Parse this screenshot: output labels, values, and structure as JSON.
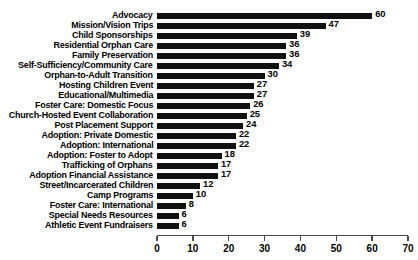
{
  "chart_data": {
    "type": "bar",
    "orientation": "horizontal",
    "title": "",
    "subtitle": "",
    "xlabel": "",
    "ylabel": "",
    "xlim": [
      0,
      70
    ],
    "xticks": [
      0,
      10,
      20,
      30,
      40,
      50,
      60,
      70
    ],
    "grid": false,
    "legend": false,
    "bar_color": "#111111",
    "axis_color": "#4a4a4a",
    "background_color": "#ffffff",
    "show_value_labels": true,
    "categories": [
      "Advocacy",
      "Mission/Vision Trips",
      "Child Sponsorships",
      "Residential Orphan Care",
      "Family Preservation",
      "Self-Sufficiency/Community Care",
      "Orphan-to-Adult Transition",
      "Hosting Children Event",
      "Educational/Multimedia",
      "Foster Care: Domestic Focus",
      "Church-Hosted Event Collaboration",
      "Post Placement Support",
      "Adoption: Private Domestic",
      "Adoption: International",
      "Adoption: Foster to Adopt",
      "Trafficking of Orphans",
      "Adoption Financial Assistance",
      "Street/Incarcerated Children",
      "Camp Programs",
      "Foster Care: International",
      "Special Needs Resources",
      "Athletic Event Fundraisers"
    ],
    "values": [
      60,
      47,
      39,
      36,
      36,
      34,
      30,
      27,
      27,
      26,
      25,
      24,
      22,
      22,
      18,
      17,
      17,
      12,
      10,
      8,
      6,
      6
    ]
  }
}
